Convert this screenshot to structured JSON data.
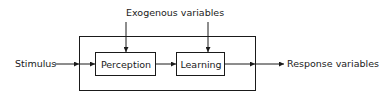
{
  "diagram": {
    "type": "block-diagram",
    "nodes": {
      "perception": {
        "label": "Perception"
      },
      "learning": {
        "label": "Learning"
      }
    },
    "inputs": {
      "stimulus": {
        "label": "Stimulus"
      },
      "exogenous": {
        "label": "Exogenous variables"
      }
    },
    "outputs": {
      "response": {
        "label": "Response variables"
      }
    },
    "edges": [
      {
        "from": "Stimulus",
        "to": "Perception"
      },
      {
        "from": "Perception",
        "to": "Learning"
      },
      {
        "from": "Exogenous variables",
        "to": "Perception"
      },
      {
        "from": "Exogenous variables",
        "to": "Learning"
      },
      {
        "from": "Learning",
        "to": "Response variables"
      }
    ],
    "colors": {
      "line": "#1a1a1a",
      "background": "#ffffff"
    }
  }
}
